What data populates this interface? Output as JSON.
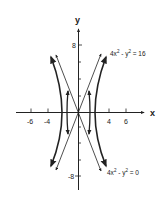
{
  "diagram": {
    "type": "coordinate-graph",
    "axes": {
      "x_label": "x",
      "y_label": "y",
      "x_ticks": [
        {
          "value": -6,
          "label": "-6"
        },
        {
          "value": -4,
          "label": "-4"
        },
        {
          "value": 4,
          "label": "4"
        },
        {
          "value": 6,
          "label": "6"
        }
      ],
      "y_ticks": [
        {
          "value": 8,
          "label": "8"
        },
        {
          "value": -8,
          "label": "-8"
        }
      ]
    },
    "curves": [
      {
        "name": "hyperbola",
        "equation_base": "4x",
        "equation_mid": " - y",
        "equation_end": " = 16",
        "sup": "2"
      },
      {
        "name": "asymptotes",
        "equation_base": "4x",
        "equation_mid": " - y",
        "equation_end": " = 0",
        "sup": "2"
      }
    ],
    "colors": {
      "ink": "#222222",
      "background": "#ffffff"
    }
  }
}
